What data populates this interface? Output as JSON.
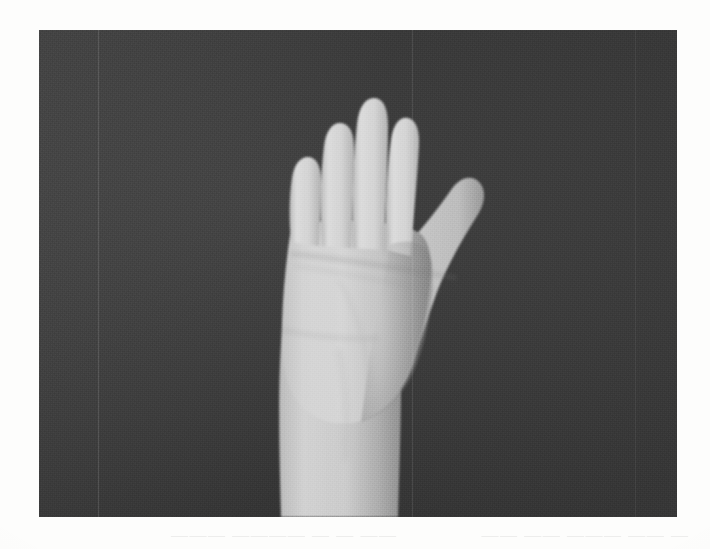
{
  "document": {
    "type": "scanned-photograph-page",
    "page_background": "#fdfdfc"
  },
  "photo": {
    "name": "hand-photograph",
    "caption": "",
    "background_color": "#3b3b3b",
    "skin_highlight_color": "#d2d2d2",
    "skin_midtone_color": "#c0c0c0",
    "skin_shadow_color": "#8d8d8d",
    "frame": {
      "x": 39,
      "y": 30,
      "width": 638,
      "height": 487
    },
    "subject": {
      "label": "Left hand and forearm, palmar view, fingers adducted and extended, thumb abducted",
      "parts": [
        {
          "name": "index-finger",
          "label": "Index finger"
        },
        {
          "name": "middle-finger",
          "label": "Middle finger"
        },
        {
          "name": "ring-finger",
          "label": "Ring finger"
        },
        {
          "name": "little-finger",
          "label": "Little finger"
        },
        {
          "name": "thumb",
          "label": "Thumb"
        },
        {
          "name": "palm",
          "label": "Palm"
        },
        {
          "name": "thenar-eminence",
          "label": "Thenar eminence"
        },
        {
          "name": "wrist-crease",
          "label": "Wrist crease"
        },
        {
          "name": "forearm",
          "label": "Forearm"
        }
      ]
    },
    "artifacts": {
      "scan_lines_label": "Vertical scan crease lines",
      "grain_label": "Photographic film grain"
    }
  },
  "ghost_text": {
    "label": "Faint show-through text from reverse of page (illegible)",
    "line_left": "— —— ——— —— ——",
    "line_right": "—— — — ———— ———"
  }
}
